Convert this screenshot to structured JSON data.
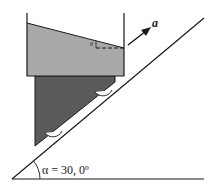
{
  "diagram": {
    "acceleration_label": "a",
    "surface_angle_label": "θ",
    "incline_angle_label": "α = 30, 0º",
    "colors": {
      "liquid": "#a9a9a9",
      "wedge": "#5a5a5a",
      "lines": "#1a1a1a",
      "background": "#ffffff"
    }
  }
}
